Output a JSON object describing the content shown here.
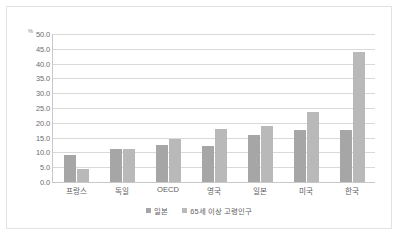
{
  "chart_data": {
    "type": "bar",
    "title": "",
    "subtitle": "",
    "xlabel": "",
    "ylabel": "",
    "unit_label": "%",
    "ylim": [
      0,
      50
    ],
    "ytick_labels": [
      "50.0",
      "45.0",
      "40.0",
      "35.0",
      "30.0",
      "25.0",
      "20.0",
      "15.0",
      "10.0",
      "5.0",
      "0.0"
    ],
    "ytick_values": [
      50,
      45,
      40,
      35,
      30,
      25,
      20,
      15,
      10,
      5,
      0
    ],
    "grid": true,
    "legend_position": "bottom",
    "categories": [
      "프랑스",
      "독일",
      "OECD",
      "영국",
      "일본",
      "미국",
      "한국"
    ],
    "series": [
      {
        "name": "일본",
        "color": "#a6a6a6",
        "values": [
          9.0,
          11.0,
          12.5,
          12.0,
          16.0,
          17.5,
          17.5
        ]
      },
      {
        "name": "65세 이상 고령인구",
        "color": "#b9b9b9",
        "values": [
          4.5,
          11.0,
          14.5,
          18.0,
          19.0,
          23.5,
          44.0
        ]
      }
    ]
  },
  "colors": {
    "series1": "#a6a6a6",
    "series2": "#b9b9b9",
    "gridline": "#d9d9d9",
    "axis": "#c8c8c8",
    "frame_border": "#e2e2e2",
    "tick_text": "#6b6b6b",
    "background": "#ffffff"
  }
}
